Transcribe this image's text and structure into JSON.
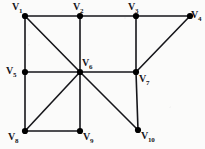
{
  "figure": {
    "kind": "undirected-graph-diagram",
    "width": 205,
    "height": 149,
    "background_color": "#fbfbfa",
    "stroke_color": "#16161a",
    "vertex_fill_color": "#000000",
    "edge_width": 1.6,
    "vertex_radius": 3.1
  },
  "vertices": [
    {
      "id": "v1",
      "label_text": "V",
      "sub": "1",
      "x": 25,
      "y": 16,
      "label_x": 12,
      "label_y": 2,
      "name": "vertex-v1"
    },
    {
      "id": "v2",
      "label_text": "V",
      "sub": "2",
      "x": 80,
      "y": 16,
      "label_x": 73,
      "label_y": 2,
      "name": "vertex-v2"
    },
    {
      "id": "v3",
      "label_text": "V",
      "sub": "3",
      "x": 136,
      "y": 16,
      "label_x": 128,
      "label_y": 2,
      "name": "vertex-v3"
    },
    {
      "id": "v4",
      "label_text": "V",
      "sub": "4",
      "x": 190,
      "y": 16,
      "label_x": 191,
      "label_y": 10,
      "name": "vertex-v4"
    },
    {
      "id": "v5",
      "label_text": "V",
      "sub": "5",
      "x": 25,
      "y": 72,
      "label_x": 6,
      "label_y": 66,
      "name": "vertex-v5"
    },
    {
      "id": "v6",
      "label_text": "V",
      "sub": "6",
      "x": 80,
      "y": 72,
      "label_x": 82,
      "label_y": 58,
      "name": "vertex-v6"
    },
    {
      "id": "v7",
      "label_text": "V",
      "sub": "7",
      "x": 136,
      "y": 72,
      "label_x": 139,
      "label_y": 74,
      "name": "vertex-v7"
    },
    {
      "id": "v8",
      "label_text": "V",
      "sub": "8",
      "x": 25,
      "y": 131,
      "label_x": 8,
      "label_y": 132,
      "name": "vertex-v8"
    },
    {
      "id": "v9",
      "label_text": "V",
      "sub": "9",
      "x": 80,
      "y": 131,
      "label_x": 83,
      "label_y": 132,
      "name": "vertex-v9"
    },
    {
      "id": "v10",
      "label_text": "V",
      "sub": "10",
      "x": 138,
      "y": 130,
      "label_x": 141,
      "label_y": 131,
      "name": "vertex-v10"
    }
  ],
  "edges": [
    {
      "from": "v1",
      "to": "v2",
      "name": "edge-v1-v2"
    },
    {
      "from": "v2",
      "to": "v3",
      "name": "edge-v2-v3"
    },
    {
      "from": "v3",
      "to": "v4",
      "name": "edge-v3-v4"
    },
    {
      "from": "v1",
      "to": "v5",
      "name": "edge-v1-v5"
    },
    {
      "from": "v1",
      "to": "v6",
      "name": "edge-v1-v6"
    },
    {
      "from": "v2",
      "to": "v6",
      "name": "edge-v2-v6"
    },
    {
      "from": "v3",
      "to": "v7",
      "name": "edge-v3-v7"
    },
    {
      "from": "v4",
      "to": "v7",
      "name": "edge-v4-v7"
    },
    {
      "from": "v5",
      "to": "v6",
      "name": "edge-v5-v6"
    },
    {
      "from": "v6",
      "to": "v7",
      "name": "edge-v6-v7"
    },
    {
      "from": "v5",
      "to": "v8",
      "name": "edge-v5-v8"
    },
    {
      "from": "v6",
      "to": "v8",
      "name": "edge-v6-v8"
    },
    {
      "from": "v6",
      "to": "v9",
      "name": "edge-v6-v9"
    },
    {
      "from": "v6",
      "to": "v10",
      "name": "edge-v6-v10"
    },
    {
      "from": "v7",
      "to": "v10",
      "name": "edge-v7-v10"
    },
    {
      "from": "v8",
      "to": "v9",
      "name": "edge-v8-v9"
    }
  ]
}
